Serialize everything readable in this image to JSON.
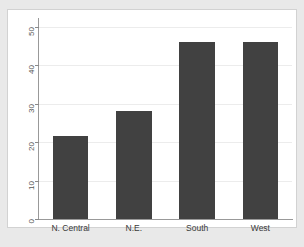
{
  "chart_data": {
    "type": "bar",
    "title": "",
    "subtitle": "",
    "xlabel": "",
    "ylabel": "",
    "categories": [
      "N. Central",
      "N.E.",
      "South",
      "West"
    ],
    "values": [
      21.5,
      28,
      46,
      46
    ],
    "ylim": [
      0,
      50
    ],
    "yticks": [
      0,
      10,
      20,
      30,
      40,
      50
    ],
    "ytick_labels": [
      "0",
      "10",
      "20",
      "30",
      "40",
      "50"
    ],
    "ytick_rotation": 90,
    "grid": true,
    "grid_axis": "y",
    "legend": false,
    "legend_position": "none",
    "bar_color": "#414141",
    "plot_background": "#ffffff",
    "figure_background": "#e9e9e9",
    "gridline_color": "#ececec",
    "axis_color": "#999999"
  },
  "figure": {
    "clipped_text_above": "",
    "frame_border_color": "#d2d2d2"
  }
}
